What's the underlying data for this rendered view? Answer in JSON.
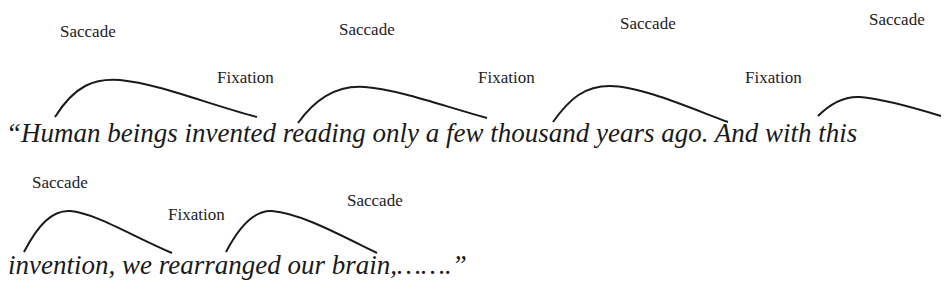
{
  "diagram": {
    "labels": [
      {
        "text": "Saccade",
        "x": 60,
        "y": 22
      },
      {
        "text": "Saccade",
        "x": 339,
        "y": 20
      },
      {
        "text": "Saccade",
        "x": 620,
        "y": 14
      },
      {
        "text": "Saccade",
        "x": 869,
        "y": 10
      },
      {
        "text": "Fixation",
        "x": 217,
        "y": 68
      },
      {
        "text": "Fixation",
        "x": 478,
        "y": 68
      },
      {
        "text": "Fixation",
        "x": 745,
        "y": 68
      },
      {
        "text": "Saccade",
        "x": 32,
        "y": 175
      },
      {
        "text": "Fixation",
        "x": 168,
        "y": 205
      },
      {
        "text": "Saccade",
        "x": 347,
        "y": 192
      }
    ],
    "text_lines": [
      "“Human beings invented reading only a few thousand years ago. And with this",
      "invention, we rearranged our brain,…….”"
    ]
  }
}
